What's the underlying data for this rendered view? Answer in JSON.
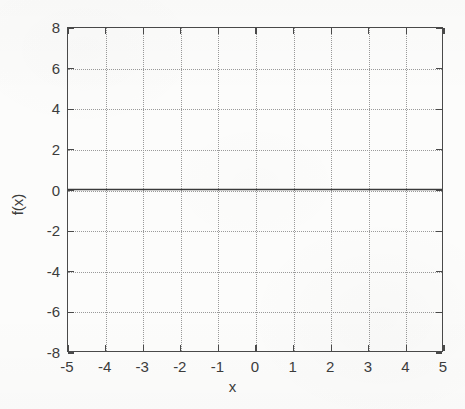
{
  "figure": {
    "width": 465,
    "height": 409,
    "background_color": "#fcfcfb",
    "axis_color": "#4a4a4a",
    "grid_color": "#9a9a9a",
    "line_color": "#3a3a3a"
  },
  "chart_data": {
    "type": "line",
    "title": "",
    "subtitle": "",
    "xlabel": "x",
    "ylabel": "f(x)",
    "xlim": [
      -5,
      5
    ],
    "ylim": [
      -8,
      8
    ],
    "xticks": [
      -5,
      -4,
      -3,
      -2,
      -1,
      0,
      1,
      2,
      3,
      4,
      5
    ],
    "yticks": [
      -8,
      -6,
      -4,
      -2,
      0,
      2,
      4,
      6,
      8
    ],
    "xticklabels": [
      "-5",
      "-4",
      "-3",
      "-2",
      "-1",
      "0",
      "1",
      "2",
      "3",
      "4",
      "5"
    ],
    "yticklabels": [
      "-8",
      "-6",
      "-4",
      "-2",
      "0",
      "2",
      "4",
      "6",
      "8"
    ],
    "grid": true,
    "grid_style": "dotted",
    "legend": false,
    "legend_position": "none",
    "annotations": [],
    "series": [
      {
        "name": "f(x)",
        "style": "solid",
        "color": "#3a3a3a",
        "width": 1.3,
        "x": [
          -5,
          -4,
          -3,
          -2,
          -1,
          0,
          1,
          2,
          3,
          4,
          5
        ],
        "values": [
          0,
          0,
          0,
          0,
          0,
          0,
          0,
          0,
          0,
          0,
          0
        ]
      }
    ]
  }
}
